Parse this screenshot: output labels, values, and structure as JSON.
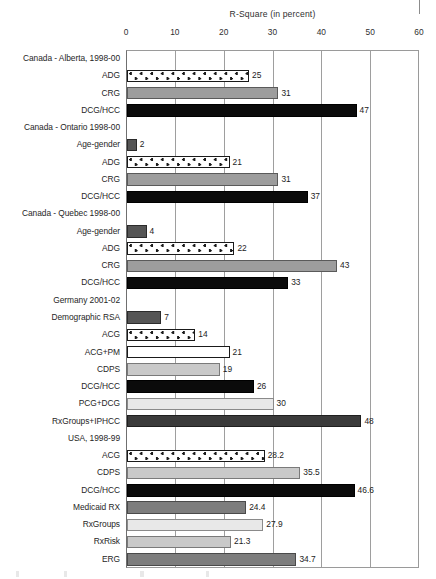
{
  "chart_data": {
    "type": "bar",
    "orientation": "horizontal",
    "title": "R-Square (in percent)",
    "xlabel": "",
    "ylabel": "",
    "xlim": [
      0,
      60
    ],
    "xticks": [
      0,
      10,
      20,
      30,
      40,
      50,
      60
    ],
    "grid": true,
    "legend": "none",
    "rows": [
      {
        "label": "Canada - Alberta, 1998-00",
        "type": "group",
        "value": null,
        "value_label": "",
        "style": "none"
      },
      {
        "label": "ADG",
        "type": "bar",
        "value": 25,
        "value_label": "25",
        "style": "dots"
      },
      {
        "label": "CRG",
        "type": "bar",
        "value": 31,
        "value_label": "31",
        "style": "midgray"
      },
      {
        "label": "DCG/HCC",
        "type": "bar",
        "value": 47,
        "value_label": "47",
        "style": "black"
      },
      {
        "label": "Canada - Ontario 1998-00",
        "type": "group",
        "value": null,
        "value_label": "",
        "style": "none"
      },
      {
        "label": "Age-gender",
        "type": "bar",
        "value": 2,
        "value_label": "2",
        "style": "darkgray"
      },
      {
        "label": "ADG",
        "type": "bar",
        "value": 21,
        "value_label": "21",
        "style": "dots"
      },
      {
        "label": "CRG",
        "type": "bar",
        "value": 31,
        "value_label": "31",
        "style": "midgray"
      },
      {
        "label": "DCG/HCC",
        "type": "bar",
        "value": 37,
        "value_label": "37",
        "style": "black"
      },
      {
        "label": "Canada - Quebec 1998-00",
        "type": "group",
        "value": null,
        "value_label": "",
        "style": "none"
      },
      {
        "label": "Age-gender",
        "type": "bar",
        "value": 4,
        "value_label": "4",
        "style": "darkgray"
      },
      {
        "label": "ADG",
        "type": "bar",
        "value": 22,
        "value_label": "22",
        "style": "dots"
      },
      {
        "label": "CRG",
        "type": "bar",
        "value": 43,
        "value_label": "43",
        "style": "midgray"
      },
      {
        "label": "DCG/HCC",
        "type": "bar",
        "value": 33,
        "value_label": "33",
        "style": "black"
      },
      {
        "label": "Germany 2001-02",
        "type": "group",
        "value": null,
        "value_label": "",
        "style": "none"
      },
      {
        "label": "Demographic RSA",
        "type": "bar",
        "value": 7,
        "value_label": "7",
        "style": "darkgray"
      },
      {
        "label": "ACG",
        "type": "bar",
        "value": 14,
        "value_label": "14",
        "style": "dots"
      },
      {
        "label": "ACG+PM",
        "type": "bar",
        "value": 21,
        "value_label": "21",
        "style": "white"
      },
      {
        "label": "CDPS",
        "type": "bar",
        "value": 19,
        "value_label": "19",
        "style": "lightgray"
      },
      {
        "label": "DCG/HCC",
        "type": "bar",
        "value": 26,
        "value_label": "26",
        "style": "black"
      },
      {
        "label": "PCG+DCG",
        "type": "bar",
        "value": 30,
        "value_label": "30",
        "style": "verylight"
      },
      {
        "label": "RxGroups+IPHCC",
        "type": "bar",
        "value": 48,
        "value_label": "48",
        "style": "deepgray"
      },
      {
        "label": "USA, 1998-99",
        "type": "group",
        "value": null,
        "value_label": "",
        "style": "none"
      },
      {
        "label": "ACG",
        "type": "bar",
        "value": 28.2,
        "value_label": "28.2",
        "style": "dots"
      },
      {
        "label": "CDPS",
        "type": "bar",
        "value": 35.5,
        "value_label": "35.5",
        "style": "lightgray"
      },
      {
        "label": "DCG/HCC",
        "type": "bar",
        "value": 46.6,
        "value_label": "46.6",
        "style": "black"
      },
      {
        "label": "Medicaid RX",
        "type": "bar",
        "value": 24.4,
        "value_label": "24.4",
        "style": "slate"
      },
      {
        "label": "RxGroups",
        "type": "bar",
        "value": 27.9,
        "value_label": "27.9",
        "style": "verylight"
      },
      {
        "label": "RxRisk",
        "type": "bar",
        "value": 21.3,
        "value_label": "21.3",
        "style": "lightgray"
      },
      {
        "label": "ERG",
        "type": "bar",
        "value": 34.7,
        "value_label": "34.7",
        "style": "slate"
      }
    ]
  },
  "colors": {
    "axis": "#9a9a9a",
    "grid": "#9e9e9e",
    "text": "#262626",
    "black_bar": "#0b0b0b",
    "mid_gray_bar": "#9d9d9d",
    "dark_gray_bar": "#555555",
    "light_gray_bar": "#c9c9c9",
    "very_light_bar": "#e8e8e8",
    "deep_gray_bar": "#3b3b3b",
    "slate_bar": "#7d7d7d"
  }
}
